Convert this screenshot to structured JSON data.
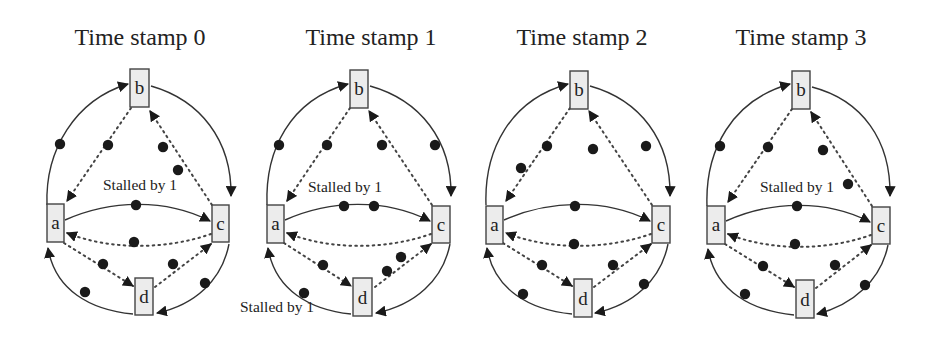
{
  "figure": {
    "panels": [
      {
        "title": "Time stamp 0",
        "nodes": [
          "a",
          "b",
          "c",
          "d"
        ],
        "labels": [
          "Stalled by 1"
        ]
      },
      {
        "title": "Time stamp 1",
        "nodes": [
          "a",
          "b",
          "c",
          "d"
        ],
        "labels": [
          "Stalled by 1",
          "Stalled by 1"
        ]
      },
      {
        "title": "Time stamp 2",
        "nodes": [
          "a",
          "b",
          "c",
          "d"
        ],
        "labels": []
      },
      {
        "title": "Time stamp 3",
        "nodes": [
          "a",
          "b",
          "c",
          "d"
        ],
        "labels": [
          "Stalled by 1"
        ]
      }
    ],
    "edges": [
      {
        "from": "a",
        "to": "b",
        "style": "solid",
        "route": "outer-left-top"
      },
      {
        "from": "b",
        "to": "c",
        "style": "solid",
        "route": "outer-right-top"
      },
      {
        "from": "c",
        "to": "d",
        "style": "solid",
        "route": "outer-right-bottom"
      },
      {
        "from": "d",
        "to": "a",
        "style": "solid",
        "route": "outer-left-bottom"
      },
      {
        "from": "a",
        "to": "c",
        "style": "solid",
        "route": "middle"
      },
      {
        "from": "c",
        "to": "a",
        "style": "dotted",
        "route": "middle"
      },
      {
        "from": "b",
        "to": "a",
        "style": "dotted",
        "route": "inner"
      },
      {
        "from": "c",
        "to": "b",
        "style": "dotted",
        "route": "inner"
      },
      {
        "from": "a",
        "to": "d",
        "style": "dotted",
        "route": "inner"
      },
      {
        "from": "d",
        "to": "c",
        "style": "dotted",
        "route": "inner"
      }
    ],
    "tokens_per_panel": [
      {
        "a->b": 1,
        "b->c": 0,
        "c->d": 1,
        "d->a": 1,
        "a->c": 1,
        "c->a": 1,
        "b->a": 1,
        "c->b": 2,
        "a->d": 1,
        "d->c": 1
      },
      {
        "a->b": 1,
        "b->c": 1,
        "c->d": 0,
        "d->a": 1,
        "a->c": 2,
        "c->a": 0,
        "b->a": 1,
        "c->b": 1,
        "a->d": 1,
        "d->c": 2
      },
      {
        "a->b": 0,
        "b->c": 1,
        "c->d": 1,
        "d->a": 1,
        "a->c": 1,
        "c->a": 1,
        "b->a": 2,
        "c->b": 1,
        "a->d": 1,
        "d->c": 1
      },
      {
        "a->b": 1,
        "b->c": 0,
        "c->d": 1,
        "d->a": 1,
        "a->c": 1,
        "c->a": 1,
        "b->a": 1,
        "c->b": 2,
        "a->d": 1,
        "d->c": 1
      }
    ],
    "colors": {
      "node_fill": "#ececec",
      "stroke": "#333333",
      "token": "#1a1a1a",
      "background": "#ffffff"
    }
  }
}
